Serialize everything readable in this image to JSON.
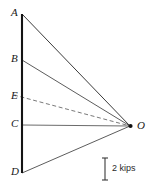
{
  "figure": {
    "kind": "force-polygon-ray-diagram",
    "width": 152,
    "height": 190,
    "background_color": "#ffffff"
  },
  "labels": {
    "a": "A",
    "b": "B",
    "e": "E",
    "c": "C",
    "d": "D",
    "o": "O"
  },
  "scale": {
    "caption": "2 kips"
  },
  "chart_data": {
    "type": "line",
    "title": "",
    "xlabel": "",
    "ylabel": "",
    "pole": {
      "name": "O",
      "x": 130,
      "y": 126
    },
    "load_line": {
      "x": 22,
      "from_y": 14,
      "to_y": 173,
      "color": "#141414",
      "width": 2.1
    },
    "points": [
      {
        "name": "A",
        "x": 22,
        "y": 14,
        "label_x": 11,
        "label_y": 11
      },
      {
        "name": "B",
        "x": 22,
        "y": 60,
        "label_x": 11,
        "label_y": 57
      },
      {
        "name": "E",
        "x": 22,
        "y": 97,
        "label_x": 11,
        "label_y": 94
      },
      {
        "name": "C",
        "x": 22,
        "y": 125,
        "label_x": 11,
        "label_y": 122
      },
      {
        "name": "D",
        "x": 22,
        "y": 173,
        "label_x": 11,
        "label_y": 170
      }
    ],
    "rays": [
      {
        "from": "A",
        "to": "O",
        "style": "solid",
        "color": "#3a3a3a",
        "width": 1.0
      },
      {
        "from": "B",
        "to": "O",
        "style": "solid",
        "color": "#4a4a4a",
        "width": 0.9
      },
      {
        "from": "E",
        "to": "O",
        "style": "dashed",
        "color": "#6a6a6a",
        "width": 0.9
      },
      {
        "from": "C",
        "to": "O",
        "style": "solid",
        "color": "#5a5a5a",
        "width": 0.9
      },
      {
        "from": "D",
        "to": "O",
        "style": "solid",
        "color": "#4a4a4a",
        "width": 0.9
      }
    ],
    "scale_bar": {
      "x": 105,
      "top_y": 158,
      "bottom_y": 180,
      "cap_half_width": 3,
      "value": 2,
      "unit": "kips",
      "label_x": 112,
      "label_y": 165,
      "color": "#3a3a3a"
    }
  }
}
